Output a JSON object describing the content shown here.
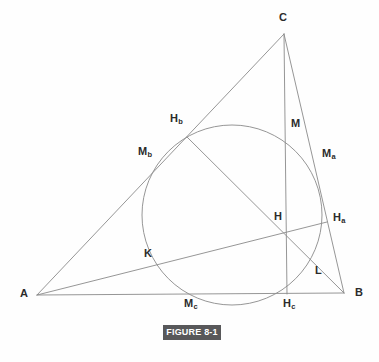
{
  "figure": {
    "caption": "FIGURE 8-1",
    "caption_bg": "#58585a",
    "caption_fg": "#ffffff",
    "line_color": "#8a8a8a",
    "label_color": "#2b2b2b",
    "background": "#fefefe"
  },
  "chart_data": {
    "type": "diagram",
    "title": "FIGURE 8-1",
    "canvas": {
      "width": 379,
      "height": 362
    },
    "vertices": {
      "A": {
        "x": 37,
        "y": 295,
        "label": "A"
      },
      "B": {
        "x": 344,
        "y": 293,
        "label": "B"
      },
      "C": {
        "x": 284,
        "y": 34,
        "label": "C"
      }
    },
    "points": [
      {
        "id": "A",
        "label": "A",
        "sub": "",
        "x": 37,
        "y": 295,
        "label_x": 20,
        "label_y": 288,
        "role": "vertex"
      },
      {
        "id": "B",
        "label": "B",
        "sub": "",
        "x": 344,
        "y": 293,
        "label_x": 355,
        "label_y": 287,
        "role": "vertex"
      },
      {
        "id": "C",
        "label": "C",
        "sub": "",
        "x": 284,
        "y": 34,
        "label_x": 279,
        "label_y": 12,
        "role": "vertex"
      },
      {
        "id": "Ha",
        "label": "H",
        "sub": "a",
        "x": 327,
        "y": 222,
        "label_x": 333,
        "label_y": 212,
        "role": "altitude-foot"
      },
      {
        "id": "Hb",
        "label": "H",
        "sub": "b",
        "x": 187,
        "y": 137,
        "label_x": 170,
        "label_y": 113,
        "role": "altitude-foot"
      },
      {
        "id": "Hc",
        "label": "H",
        "sub": "c",
        "x": 287,
        "y": 294,
        "label_x": 283,
        "label_y": 298,
        "role": "altitude-foot"
      },
      {
        "id": "Ma",
        "label": "M",
        "sub": "a",
        "x": 314,
        "y": 163,
        "label_x": 322,
        "label_y": 148,
        "role": "side-midpoint"
      },
      {
        "id": "Mb",
        "label": "M",
        "sub": "b",
        "x": 160,
        "y": 164,
        "label_x": 138,
        "label_y": 146,
        "role": "side-midpoint"
      },
      {
        "id": "Mc",
        "label": "M",
        "sub": "c",
        "x": 190,
        "y": 294,
        "label_x": 184,
        "label_y": 298,
        "role": "side-midpoint"
      },
      {
        "id": "M",
        "label": "M",
        "sub": "",
        "x": 286,
        "y": 122,
        "label_x": 291,
        "label_y": 118,
        "role": "euler-point"
      },
      {
        "id": "H",
        "label": "H",
        "sub": "",
        "x": 286,
        "y": 232,
        "label_x": 274,
        "label_y": 211,
        "role": "orthocenter"
      },
      {
        "id": "K",
        "label": "K",
        "sub": "",
        "x": 159,
        "y": 259,
        "label_x": 144,
        "label_y": 248,
        "role": "euler-point"
      },
      {
        "id": "L",
        "label": "L",
        "sub": "",
        "x": 310,
        "y": 265,
        "label_x": 315,
        "label_y": 265,
        "role": "euler-point"
      }
    ],
    "circle": {
      "name": "nine-point-circle",
      "cx": 232,
      "cy": 215,
      "r": 90
    },
    "segments": [
      {
        "name": "side-AB",
        "from": "A",
        "to": "B"
      },
      {
        "name": "side-BC",
        "from": "B",
        "to": "C"
      },
      {
        "name": "side-CA",
        "from": "C",
        "to": "A"
      },
      {
        "name": "altitude-from-C",
        "from": "C",
        "to": "Hc"
      },
      {
        "name": "altitude-from-B",
        "from": "B",
        "to": "Hb"
      },
      {
        "name": "altitude-from-A",
        "from": "A",
        "to": "Ha"
      }
    ]
  }
}
